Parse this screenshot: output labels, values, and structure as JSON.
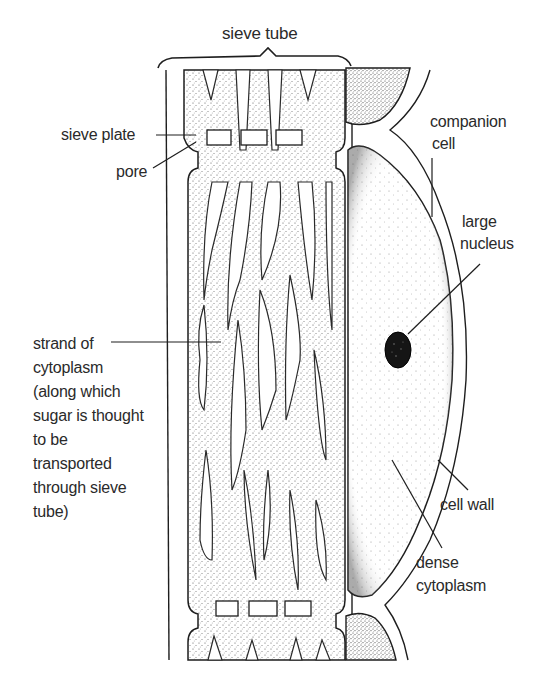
{
  "diagram": {
    "colors": {
      "ink": "#1e1e1e",
      "stipple": "#3a3a3a",
      "nucleus": "#111111",
      "background": "#ffffff"
    },
    "labels": {
      "sieve_tube": "sieve tube",
      "sieve_plate": "sieve plate",
      "pore": "pore",
      "companion_cell_1": "companion",
      "companion_cell_2": "cell",
      "large_nucleus_1": "large",
      "large_nucleus_2": "nucleus",
      "strand": {
        "line1": "strand of",
        "line2": "cytoplasm",
        "line3": "(along which",
        "line4": "sugar is thought",
        "line5": "to be",
        "line6": "transported",
        "line7": "through sieve",
        "line8": "tube)"
      },
      "cell_wall": "cell wall",
      "dense_cytoplasm_1": "dense",
      "dense_cytoplasm_2": "cytoplasm"
    }
  }
}
